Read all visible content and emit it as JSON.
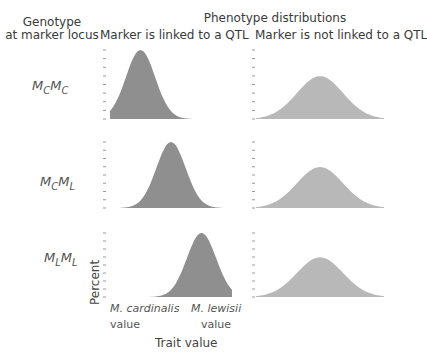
{
  "headers": {
    "genotype_line1": "Genotype",
    "genotype_line2": "at marker locus",
    "phenotype": "Phenotype distributions",
    "linked": "Marker is linked to a QTL",
    "not_linked": "Marker is not linked to a QTL"
  },
  "rows": [
    {
      "m1": "M",
      "s1": "C",
      "m2": "M",
      "s2": "C"
    },
    {
      "m1": "M",
      "s1": "C",
      "m2": "M",
      "s2": "L"
    },
    {
      "m1": "M",
      "s1": "L",
      "m2": "M",
      "s2": "L"
    }
  ],
  "axes": {
    "y_label": "Percent",
    "x_label": "Trait value",
    "x_left_line1": "M. cardinalis",
    "x_left_line2": "value",
    "x_right_line1": "M. lewisii",
    "x_right_line2": "value"
  },
  "colors": {
    "linked_fill": "#8f8f8f",
    "notlinked_fill": "#b8b8b8",
    "tick": "#999999"
  },
  "chart_data": {
    "type": "area",
    "title": "Phenotype distributions",
    "xlabel": "Trait value",
    "ylabel": "Percent",
    "panels": [
      {
        "genotype": "MCMC",
        "column": "linked",
        "mean": 0.25,
        "sd": 0.12,
        "peak": 1.0
      },
      {
        "genotype": "MCML",
        "column": "linked",
        "mean": 0.5,
        "sd": 0.12,
        "peak": 1.0
      },
      {
        "genotype": "MLML",
        "column": "linked",
        "mean": 0.75,
        "sd": 0.12,
        "peak": 1.0
      },
      {
        "genotype": "MCMC",
        "column": "not_linked",
        "mean": 0.5,
        "sd": 0.18,
        "peak": 0.62
      },
      {
        "genotype": "MCML",
        "column": "not_linked",
        "mean": 0.5,
        "sd": 0.18,
        "peak": 0.62
      },
      {
        "genotype": "MLML",
        "column": "not_linked",
        "mean": 0.5,
        "sd": 0.18,
        "peak": 0.62
      }
    ]
  }
}
